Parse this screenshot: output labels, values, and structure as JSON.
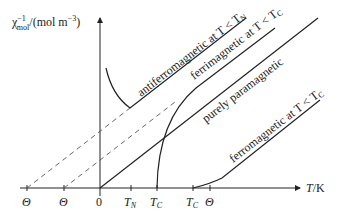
{
  "axes": {
    "y_label_base": "χ",
    "y_label_sup": "−1",
    "y_label_sub": "mol",
    "y_label_unit": "/(mol m",
    "y_label_unit_sup": "−3",
    "y_label_close": ")",
    "x_label": "T",
    "x_label_unit": "/K"
  },
  "ticks": [
    {
      "label": "Θ",
      "italic": true,
      "x": 27
    },
    {
      "label": "Θ",
      "italic": true,
      "x": 64
    },
    {
      "label": "0",
      "italic": false,
      "x": 100
    },
    {
      "label": "T",
      "sub": "N",
      "italic": true,
      "x": 131
    },
    {
      "label": "T",
      "sub": "C",
      "italic": true,
      "x": 157
    },
    {
      "label": "T",
      "sub": "C",
      "italic": true,
      "x": 193
    },
    {
      "label": "Θ",
      "italic": true,
      "x": 210
    }
  ],
  "curves": {
    "antiferromagnetic": "antiferromagnetic at T < T",
    "antiferromagnetic_sub": "N",
    "ferrimagnetic": "ferrimagnetic at T < T",
    "ferrimagnetic_sub": "C",
    "paramagnetic": "purely paramagnetic",
    "ferromagnetic": "ferromagnetic at T < T",
    "ferromagnetic_sub": "C"
  },
  "colors": {
    "line": "#222222",
    "dashed": "#555555"
  }
}
